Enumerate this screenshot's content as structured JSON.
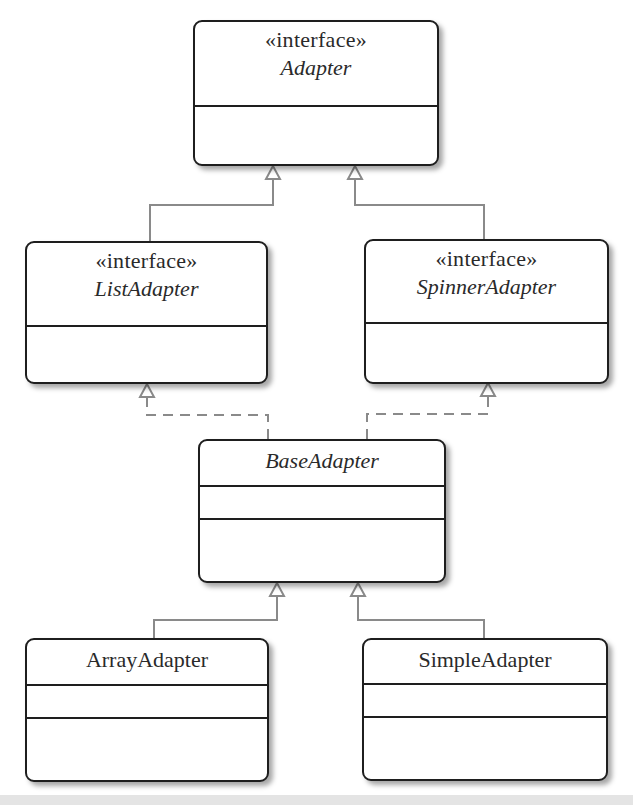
{
  "diagram": {
    "type": "UML class diagram",
    "line_color": "#8a8a8a",
    "box_border_color": "#1e1e1e",
    "classes": [
      {
        "id": "adapter",
        "stereotype": "«interface»",
        "name": "Adapter",
        "italic": true,
        "compartments": 2
      },
      {
        "id": "list_adapter",
        "stereotype": "«interface»",
        "name": "ListAdapter",
        "italic": true,
        "compartments": 2
      },
      {
        "id": "spinner_adapter",
        "stereotype": "«interface»",
        "name": "SpinnerAdapter",
        "italic": true,
        "compartments": 2
      },
      {
        "id": "base_adapter",
        "stereotype": "",
        "name": "BaseAdapter",
        "italic": true,
        "compartments": 3
      },
      {
        "id": "array_adapter",
        "stereotype": "",
        "name": "ArrayAdapter",
        "italic": false,
        "compartments": 3
      },
      {
        "id": "simple_adapter",
        "stereotype": "",
        "name": "SimpleAdapter",
        "italic": false,
        "compartments": 3
      }
    ],
    "relationships": [
      {
        "from": "ListAdapter",
        "to": "Adapter",
        "kind": "generalization",
        "line": "solid"
      },
      {
        "from": "SpinnerAdapter",
        "to": "Adapter",
        "kind": "generalization",
        "line": "solid"
      },
      {
        "from": "BaseAdapter",
        "to": "ListAdapter",
        "kind": "realization",
        "line": "dashed"
      },
      {
        "from": "BaseAdapter",
        "to": "SpinnerAdapter",
        "kind": "realization",
        "line": "dashed"
      },
      {
        "from": "ArrayAdapter",
        "to": "BaseAdapter",
        "kind": "generalization",
        "line": "solid"
      },
      {
        "from": "SimpleAdapter",
        "to": "BaseAdapter",
        "kind": "generalization",
        "line": "solid"
      }
    ]
  }
}
